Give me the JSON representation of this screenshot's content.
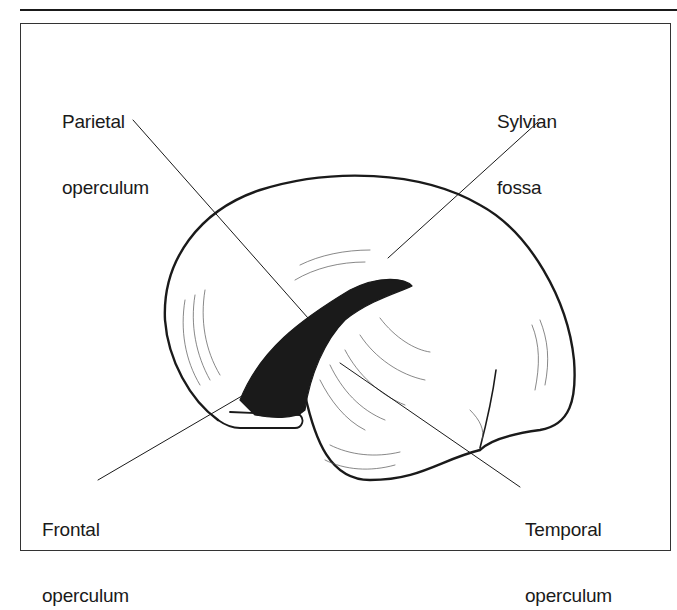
{
  "figure": {
    "labels": {
      "parietal": {
        "line1": "Parietal",
        "line2": "operculum"
      },
      "sylvian": {
        "line1": "Sylvian",
        "line2": "fossa"
      },
      "frontal": {
        "line1": "Frontal",
        "line2": "operculum"
      },
      "temporal": {
        "line1": "Temporal",
        "line2": "operculum"
      }
    },
    "colors": {
      "ink": "#1a1a1a",
      "background": "#ffffff"
    }
  }
}
